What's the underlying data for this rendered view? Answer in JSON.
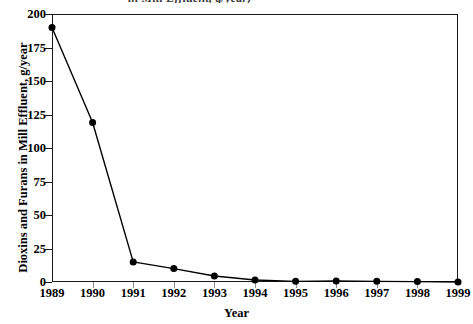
{
  "figure": {
    "title_remnant": "in Mill Effluent, g/year)",
    "background_color": "#ffffff",
    "frame_color": "#1a1a1a",
    "series_color": "#000000"
  },
  "chart_data": {
    "type": "line",
    "title": "",
    "xlabel": "Year",
    "ylabel": "Dioxins and Furans in Mill Effluent, g/year",
    "categories": [
      "1989",
      "1990",
      "1991",
      "1992",
      "1993",
      "1994",
      "1995",
      "1996",
      "1997",
      "1998",
      "1999"
    ],
    "x": [
      1989,
      1990,
      1991,
      1992,
      1993,
      1994,
      1995,
      1996,
      1997,
      1998,
      1999
    ],
    "values": [
      190,
      119,
      15,
      10,
      4.5,
      1.5,
      0.5,
      0.7,
      0.5,
      0.3,
      0
    ],
    "series": [
      {
        "name": "Dioxins and Furans in Mill Effluent",
        "values": [
          190,
          119,
          15,
          10,
          4.5,
          1.5,
          0.5,
          0.7,
          0.5,
          0.3,
          0
        ]
      }
    ],
    "ylim": [
      0,
      200
    ],
    "xlim": [
      1989,
      1999
    ],
    "yticks": [
      0,
      25,
      50,
      75,
      100,
      125,
      150,
      175,
      200
    ],
    "ytick_labels": [
      "0",
      "25",
      "50",
      "75",
      "100",
      "125",
      "150",
      "175",
      "200"
    ],
    "xtick_labels": [
      "1989",
      "1990",
      "1991",
      "1992",
      "1993",
      "1994",
      "1995",
      "1996",
      "1997",
      "1998",
      "1999"
    ],
    "grid": false,
    "legend": false,
    "legend_position": "none",
    "marker": "filled-circle",
    "marker_size": 7,
    "line_width": 1.4
  }
}
